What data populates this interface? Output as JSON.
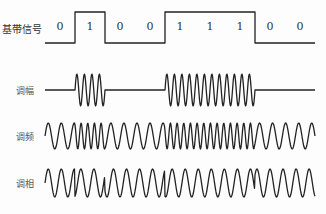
{
  "labels": {
    "baseband": "基带信号",
    "am": "调幅",
    "fm": "调频",
    "pm": "调相"
  },
  "bits": [
    "0",
    "1",
    "0",
    "0",
    "1",
    "1",
    "1",
    "0",
    "0"
  ],
  "layout": {
    "x_start": 45,
    "x_end": 315,
    "baseband": {
      "high_y": 12,
      "low_y": 43,
      "label_y": 28
    },
    "am": {
      "center_y": 90,
      "amp": 16
    },
    "fm": {
      "center_y": 136,
      "amp": 13
    },
    "pm": {
      "center_y": 183,
      "amp": 14
    }
  },
  "colors": {
    "stroke": "#222222",
    "text": "#333333"
  }
}
